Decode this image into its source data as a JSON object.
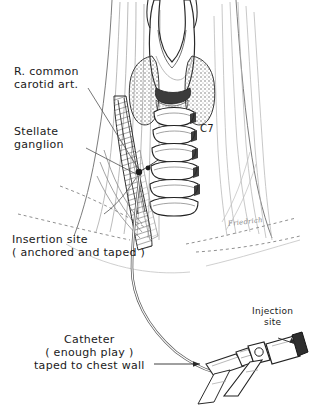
{
  "figure": {
    "ink": "#141414",
    "light_ink": "#8a8a8a",
    "stipple": "#6f6f6f",
    "background": "#ffffff"
  },
  "labels": {
    "carotid": {
      "line1": "R. common",
      "line2": "carotid art."
    },
    "stellate": {
      "line1": "Stellate",
      "line2": "ganglion"
    },
    "vertebra": {
      "text": "C7"
    },
    "insertion": {
      "line1": "Insertion site",
      "line2": "( anchored and taped )"
    },
    "catheter": {
      "line1": "Catheter",
      "line2": "( enough play )",
      "line3": "taped to chest wall"
    },
    "injection": {
      "line1": "Injection",
      "line2": "site"
    },
    "signature": {
      "text": "Friedrich"
    }
  },
  "anatomy": {
    "parts": [
      "thyroid-cartilage",
      "thyroid-gland-left-lobe",
      "thyroid-gland-right-lobe",
      "cricoid-cartilage",
      "trachea-rings",
      "sternocleidomastoid-left",
      "sternocleidomastoid-right",
      "clavicle-dashed-left",
      "clavicle-dashed-right",
      "carotid-sheath-column"
    ],
    "tracheal_ring_count": 6
  },
  "equipment": {
    "parts": [
      "catheter-tubing",
      "catheter-hub",
      "three-way-stopcock",
      "stopcock-handle",
      "injection-cap"
    ]
  }
}
